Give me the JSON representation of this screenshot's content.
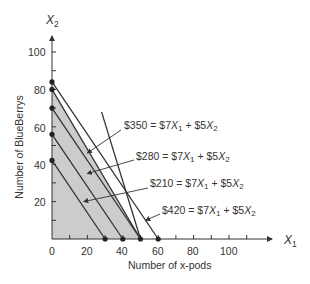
{
  "chart_data": {
    "type": "line",
    "title": "",
    "xlabel": "Number of x-pods",
    "ylabel": "Number of BlueBerrys",
    "x_axis_var": "X",
    "x_axis_sub": "1",
    "y_axis_var": "X",
    "y_axis_sub": "2",
    "xlim": [
      0,
      120
    ],
    "ylim": [
      0,
      110
    ],
    "x_ticks": [
      0,
      20,
      40,
      60,
      80,
      100
    ],
    "y_ticks": [
      20,
      40,
      60,
      80,
      100
    ],
    "x_tick_labels": [
      "0",
      "20",
      "40",
      "60",
      "80",
      "100"
    ],
    "y_tick_labels": [
      "20",
      "40",
      "60",
      "80",
      "100"
    ],
    "grid": false,
    "feasible_region": {
      "vertices": [
        [
          0,
          0
        ],
        [
          0,
          80
        ],
        [
          50,
          0
        ]
      ],
      "fill": "#cccccc"
    },
    "series": [
      {
        "name": "$210 = $7X1 + $5X2",
        "points": [
          [
            0,
            42
          ],
          [
            30,
            0
          ]
        ]
      },
      {
        "name": "$280 = $7X1 + $5X2",
        "points": [
          [
            0,
            56
          ],
          [
            40,
            0
          ]
        ]
      },
      {
        "name": "$350 = $7X1 + $5X2",
        "points": [
          [
            0,
            70
          ],
          [
            50,
            0
          ]
        ]
      },
      {
        "name": "$420 = $7X1 + $5X2",
        "points": [
          [
            0,
            84
          ],
          [
            60,
            0
          ]
        ]
      },
      {
        "name": "constraint-1",
        "points": [
          [
            0,
            80
          ],
          [
            50,
            0
          ]
        ]
      },
      {
        "name": "constraint-2",
        "points": [
          [
            28,
            68
          ],
          [
            50,
            0
          ]
        ]
      }
    ],
    "marked_points": [
      [
        0,
        84
      ],
      [
        0,
        80
      ],
      [
        0,
        70
      ],
      [
        0,
        56
      ],
      [
        0,
        42
      ],
      [
        30,
        0
      ],
      [
        40,
        0
      ],
      [
        50,
        0
      ],
      [
        60,
        0
      ]
    ],
    "annotations": [
      {
        "prefix": "$350 = $7",
        "mid": " + $5",
        "label": "$350 = $7X1 + $5X2",
        "arrow_to": [
          20,
          46
        ]
      },
      {
        "prefix": "$280 = $7",
        "mid": " + $5",
        "label": "$280 = $7X1 + $5X2",
        "arrow_to": [
          20,
          35
        ]
      },
      {
        "prefix": "$210 = $7",
        "mid": " + $5",
        "label": "$210 = $7X1 + $5X2",
        "arrow_to": [
          18,
          20
        ]
      },
      {
        "prefix": "$420 = $7",
        "mid": " + $5",
        "label": "$420 = $7X1 + $5X2",
        "arrow_to": [
          53,
          10
        ]
      }
    ]
  }
}
